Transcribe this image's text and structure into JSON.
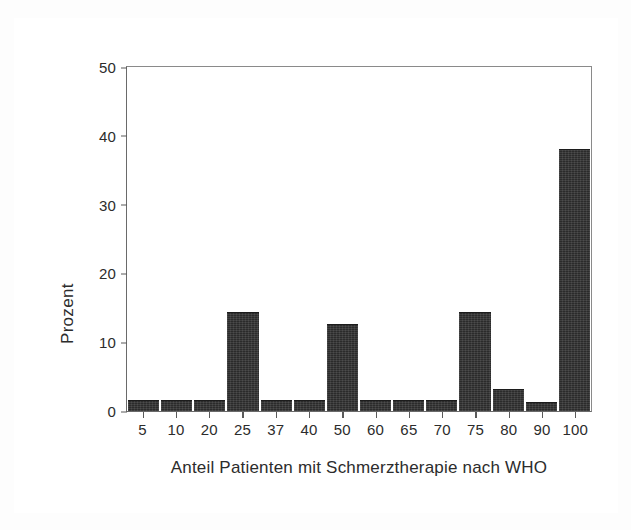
{
  "figure": {
    "background_color": "#ffffff",
    "frame_color": "#4a4a4a",
    "bar_color": "#2b2b2b",
    "axis_color": "#5a5a5a"
  },
  "chart_data": {
    "type": "bar",
    "title": "",
    "xlabel": "Anteil Patienten mit Schmerztherapie nach WHO",
    "ylabel": "Prozent",
    "categories": [
      "5",
      "10",
      "20",
      "25",
      "37",
      "40",
      "50",
      "60",
      "65",
      "70",
      "75",
      "80",
      "90",
      "100"
    ],
    "values": [
      1.4,
      1.4,
      1.4,
      14.3,
      1.4,
      1.4,
      12.5,
      1.4,
      1.4,
      1.4,
      14.3,
      3.1,
      1.1,
      38.0
    ],
    "ylim": [
      0,
      50
    ],
    "yticks": [
      "0",
      "10",
      "20",
      "30",
      "40",
      "50"
    ],
    "ytick_values": [
      0,
      10,
      20,
      30,
      40,
      50
    ],
    "grid": false,
    "legend": false,
    "legend_position": "none"
  }
}
